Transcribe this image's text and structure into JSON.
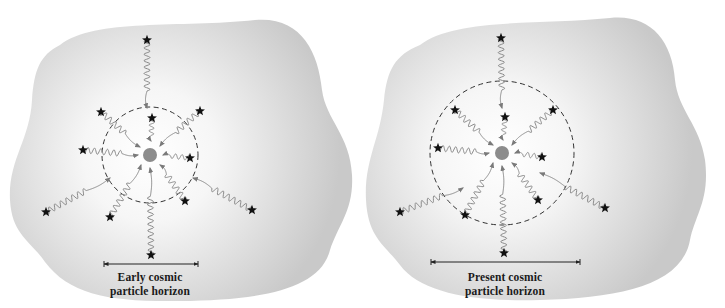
{
  "colors": {
    "blob_edge": "#c9c9c9",
    "blob_center": "#ffffff",
    "wave": "#8a8a8a",
    "star": "#111111",
    "observer": "#8c8c8c",
    "dashed_circle": "#333333",
    "measure_line": "#222222"
  },
  "panels": [
    {
      "id": "early",
      "label_line1": "Early cosmic",
      "label_line2": "particle horizon",
      "center": [
        150,
        155
      ],
      "horizon_radius": 48,
      "blob_path": "M 60 45 C 95 18, 180 28, 255 20 C 300 16, 318 50, 322 90 C 326 120, 350 135, 352 175 C 354 210, 338 225, 330 250 C 320 290, 260 300, 180 301 C 110 302, 70 295, 45 262 C 30 240, 12 235, 10 200 C 8 160, 30 140, 32 100 C 34 70, 40 55, 60 45 Z",
      "measure": {
        "x1": 104,
        "x2": 198,
        "y": 264
      },
      "label_pos": {
        "x": 150,
        "y": 270
      },
      "photons": [
        {
          "star": [
            147,
            40
          ],
          "end": [
            147,
            108
          ],
          "amp": 3,
          "waves": 8
        },
        {
          "star": [
            152,
            118
          ],
          "end": [
            151,
            141
          ],
          "amp": 2.5,
          "waves": 3
        },
        {
          "star": [
            101,
            112
          ],
          "end": [
            140,
            147
          ],
          "amp": 3,
          "waves": 5
        },
        {
          "star": [
            200,
            111
          ],
          "end": [
            160,
            146
          ],
          "amp": 3,
          "waves": 5
        },
        {
          "star": [
            83,
            150
          ],
          "end": [
            138,
            155
          ],
          "amp": 3,
          "waves": 6
        },
        {
          "star": [
            190,
            158
          ],
          "end": [
            163,
            155
          ],
          "amp": 2.5,
          "waves": 3
        },
        {
          "star": [
            46,
            212
          ],
          "end": [
            110,
            178
          ],
          "amp": 3,
          "waves": 7
        },
        {
          "star": [
            110,
            217
          ],
          "end": [
            141,
            165
          ],
          "amp": 3,
          "waves": 6
        },
        {
          "star": [
            185,
            201
          ],
          "end": [
            160,
            165
          ],
          "amp": 3,
          "waves": 5
        },
        {
          "star": [
            252,
            210
          ],
          "end": [
            193,
            178
          ],
          "amp": 3,
          "waves": 7
        },
        {
          "star": [
            151,
            255
          ],
          "end": [
            150,
            168
          ],
          "amp": 3,
          "waves": 9
        }
      ]
    },
    {
      "id": "present",
      "label_line1": "Present cosmic",
      "label_line2": "particle horizon",
      "center": [
        502,
        153
      ],
      "horizon_radius": 72,
      "blob_path": "M 420 45 C 455 18, 540 25, 610 18 C 650 14, 672 40, 675 80 C 678 110, 700 125, 705 160 C 710 200, 695 215, 690 240 C 682 285, 620 298, 540 300 C 470 302, 420 292, 400 265 C 385 245, 368 238, 366 200 C 364 160, 380 140, 384 100 C 387 70, 395 55, 420 45 Z",
      "measure": {
        "x1": 431,
        "x2": 580,
        "y": 262
      },
      "label_pos": {
        "x": 505,
        "y": 270
      },
      "photons": [
        {
          "star": [
            501,
            38
          ],
          "end": [
            502,
            108
          ],
          "amp": 3,
          "waves": 8
        },
        {
          "star": [
            505,
            117
          ],
          "end": [
            503,
            140
          ],
          "amp": 2.5,
          "waves": 3
        },
        {
          "star": [
            455,
            110
          ],
          "end": [
            493,
            145
          ],
          "amp": 3,
          "waves": 5
        },
        {
          "star": [
            553,
            110
          ],
          "end": [
            512,
            145
          ],
          "amp": 3,
          "waves": 5
        },
        {
          "star": [
            438,
            148
          ],
          "end": [
            489,
            153
          ],
          "amp": 3,
          "waves": 6
        },
        {
          "star": [
            542,
            157
          ],
          "end": [
            515,
            153
          ],
          "amp": 2.5,
          "waves": 3
        },
        {
          "star": [
            400,
            212
          ],
          "end": [
            463,
            188
          ],
          "amp": 3,
          "waves": 7
        },
        {
          "star": [
            465,
            215
          ],
          "end": [
            493,
            163
          ],
          "amp": 3,
          "waves": 6
        },
        {
          "star": [
            538,
            200
          ],
          "end": [
            512,
            163
          ],
          "amp": 3,
          "waves": 5
        },
        {
          "star": [
            605,
            208
          ],
          "end": [
            540,
            173
          ],
          "amp": 3,
          "waves": 7
        },
        {
          "star": [
            504,
            253
          ],
          "end": [
            502,
            166
          ],
          "amp": 3,
          "waves": 9
        }
      ]
    }
  ]
}
